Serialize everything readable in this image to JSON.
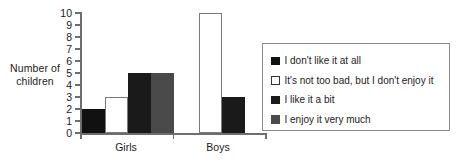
{
  "chart_data": {
    "type": "bar",
    "title": "",
    "xlabel": "",
    "ylabel": "Number of children",
    "ylim": [
      0,
      10
    ],
    "ytick_values": [
      0,
      1,
      2,
      3,
      4,
      5,
      6,
      7,
      8,
      9,
      10
    ],
    "categories": [
      "Girls",
      "Boys"
    ],
    "grid": false,
    "legend_position": "right",
    "series": [
      {
        "name": "I don't like it at all",
        "color": "#111111",
        "border": "#111111",
        "values": [
          2,
          0
        ]
      },
      {
        "name": "It's not too bad, but I don't enjoy it",
        "color": "#ffffff",
        "border": "#7a7a7a",
        "values": [
          3,
          10
        ]
      },
      {
        "name": "I like it a bit",
        "color": "#1a1a1a",
        "border": "#1a1a1a",
        "values": [
          5,
          3
        ]
      },
      {
        "name": "I enjoy it very much",
        "color": "#4a4a4a",
        "border": "#4a4a4a",
        "values": [
          5,
          0
        ]
      }
    ]
  },
  "axis": {
    "ylabel_line1": "Number of",
    "ylabel_line2": "children"
  }
}
